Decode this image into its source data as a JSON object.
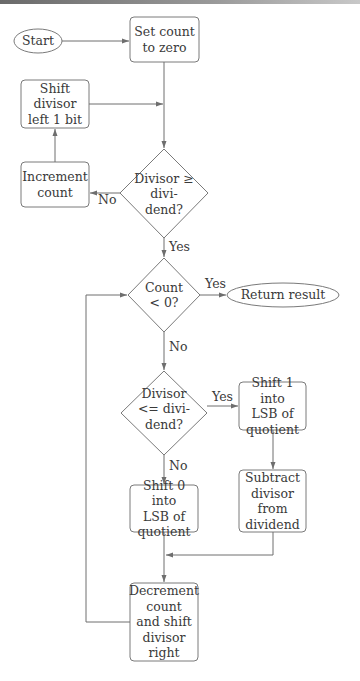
{
  "diagram": {
    "type": "flowchart",
    "nodes": {
      "start": {
        "shape": "ellipse",
        "label": "Start"
      },
      "set_count": {
        "shape": "rounded-rect",
        "lines": [
          "Set count",
          "to zero"
        ]
      },
      "shift_left": {
        "shape": "rounded-rect",
        "lines": [
          "Shift",
          "divisor",
          "left 1 bit"
        ]
      },
      "increment": {
        "shape": "rounded-rect",
        "lines": [
          "Increment",
          "count"
        ]
      },
      "decision1": {
        "shape": "diamond",
        "lines": [
          "Divisor ≥",
          "divi-",
          "dend?"
        ]
      },
      "decision2": {
        "shape": "diamond",
        "lines": [
          "Count",
          "< 0?"
        ]
      },
      "return": {
        "shape": "ellipse",
        "label": "Return result"
      },
      "decision3": {
        "shape": "diamond",
        "lines": [
          "Divisor",
          "<= divi-",
          "dend?"
        ]
      },
      "shift1": {
        "shape": "rounded-rect",
        "lines": [
          "Shift 1 into",
          "LSB of",
          "quotient"
        ]
      },
      "subtract": {
        "shape": "rounded-rect",
        "lines": [
          "Subtract",
          "divisor",
          "from",
          "dividend"
        ]
      },
      "shift0": {
        "shape": "rounded-rect",
        "lines": [
          "Shift 0 into",
          "LSB of",
          "quotient"
        ]
      },
      "decrement": {
        "shape": "rounded-rect",
        "lines": [
          "Decrement",
          "count",
          "and shift",
          "divisor",
          "right"
        ]
      }
    },
    "edge_labels": {
      "d1_no": "No",
      "d1_yes": "Yes",
      "d2_yes": "Yes",
      "d2_no": "No",
      "d3_yes": "Yes",
      "d3_no": "No"
    },
    "edges": [
      {
        "from": "start",
        "to": "set_count"
      },
      {
        "from": "set_count",
        "to": "decision1"
      },
      {
        "from": "shift_left",
        "to": "decision1"
      },
      {
        "from": "decision1",
        "to": "increment",
        "label": "No"
      },
      {
        "from": "increment",
        "to": "shift_left"
      },
      {
        "from": "decision1",
        "to": "decision2",
        "label": "Yes"
      },
      {
        "from": "decision2",
        "to": "return",
        "label": "Yes"
      },
      {
        "from": "decision2",
        "to": "decision3",
        "label": "No"
      },
      {
        "from": "decision3",
        "to": "shift1",
        "label": "Yes"
      },
      {
        "from": "decision3",
        "to": "shift0",
        "label": "No"
      },
      {
        "from": "shift1",
        "to": "subtract"
      },
      {
        "from": "subtract",
        "to": "decrement"
      },
      {
        "from": "shift0",
        "to": "decrement"
      },
      {
        "from": "decrement",
        "to": "decision2"
      }
    ],
    "colors": {
      "stroke": "#6e6e6e",
      "text": "#3a3a3a",
      "background": "#ffffff"
    }
  }
}
